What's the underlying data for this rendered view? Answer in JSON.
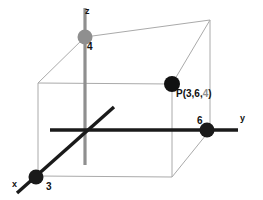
{
  "figure": {
    "type": "3d-coordinate-diagram",
    "background_color": "#ffffff"
  },
  "colors": {
    "axis_dark": "#1a1a1a",
    "axis_gray": "#8f8f8f",
    "box_line": "#aaaaaa",
    "label_text": "#111111",
    "z_value_text": "#8f8f8f"
  },
  "axes": [
    {
      "name": "x-axis",
      "label": "x",
      "color": "#1a1a1a",
      "style": "solid",
      "direction": "toward lower-left (front)"
    },
    {
      "name": "y-axis",
      "label": "y",
      "color": "#1a1a1a",
      "style": "solid",
      "direction": "toward right"
    },
    {
      "name": "z-axis",
      "label": "z",
      "color": "#8f8f8f",
      "style": "solid",
      "direction": "upward"
    }
  ],
  "markers": [
    {
      "name": "x-intercept-marker",
      "axis": "x",
      "label": "3",
      "value": 3,
      "color": "#1a1a1a",
      "position_px": {
        "x": 36,
        "y": 177
      }
    },
    {
      "name": "y-intercept-marker",
      "axis": "y",
      "label": "6",
      "value": 6,
      "color": "#1a1a1a",
      "position_px": {
        "x": 207,
        "y": 130
      }
    },
    {
      "name": "z-intercept-marker",
      "axis": "z",
      "label": "4",
      "value": 4,
      "color": "#8f8f8f",
      "position_px": {
        "x": 85,
        "y": 37
      }
    },
    {
      "name": "point-p-marker",
      "axis": "none",
      "label": "P(3,6,4)",
      "color": "#111111",
      "position_px": {
        "x": 172,
        "y": 84
      }
    }
  ],
  "point": {
    "name": "P",
    "label_prefix": "P(",
    "x": "3",
    "comma1": ",",
    "y": "6",
    "comma2": ",",
    "z": "4",
    "label_suffix": ")",
    "full_label": "P(3,6,4)"
  },
  "box": {
    "name": "reference-box",
    "line_color": "#aaaaaa",
    "description": "wireframe rectangular box from origin to P showing the 3,6,4 coordinates"
  },
  "labels": {
    "x_axis": "x",
    "y_axis": "y",
    "z_axis": "z",
    "x_value": "3",
    "y_value": "6",
    "z_value": "4"
  }
}
